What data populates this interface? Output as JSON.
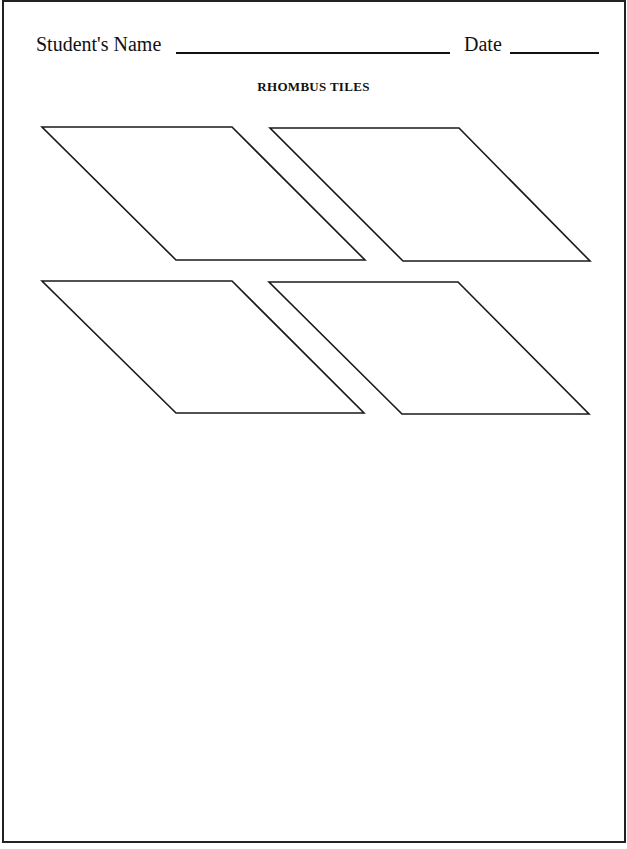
{
  "header": {
    "name_label": "Student's Name",
    "date_label": "Date"
  },
  "title": "RHOMBUS TILES",
  "tiles": [
    {
      "id": 1,
      "points": "42,127 232,127 365,260 176,260"
    },
    {
      "id": 2,
      "points": "270,128 459,128 590,261 403,261"
    },
    {
      "id": 3,
      "points": "42,281 232,281 364,413 176,413"
    },
    {
      "id": 4,
      "points": "269,282 458,282 589,414 402,414"
    }
  ],
  "colors": {
    "ink": "#1a1a1a",
    "paper": "#ffffff"
  }
}
